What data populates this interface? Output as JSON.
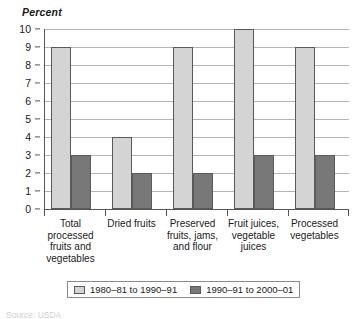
{
  "chart_data": {
    "type": "bar",
    "title": "",
    "subtitle": "",
    "xlabel": "",
    "ylabel": "Percent",
    "ylim": [
      0,
      10
    ],
    "ytick_labels": [
      "0",
      "1",
      "2",
      "3",
      "4",
      "5",
      "6",
      "7",
      "8",
      "9",
      "10"
    ],
    "grid": true,
    "legend_position": "bottom",
    "categories": [
      "Total\nprocessed\nfruits and\nvegetables",
      "Dried fruits",
      "Preserved\nfruits, jams,\nand flour",
      "Fruit juices,\nvegetable\njuices",
      "Processed\nvegetables"
    ],
    "series": [
      {
        "name": "1980–81 to 1990–91",
        "color": "#d4d4d4",
        "values": [
          9,
          4,
          9,
          10,
          9
        ]
      },
      {
        "name": "1990–91 to 2000–01",
        "color": "#787878",
        "values": [
          3,
          2,
          2,
          3,
          3
        ]
      }
    ]
  },
  "legend": {
    "entries": [
      {
        "label": "1980–81 to 1990–91"
      },
      {
        "label": "1990–91 to 2000–01"
      }
    ]
  },
  "source": {
    "text": "Source: USDA"
  }
}
